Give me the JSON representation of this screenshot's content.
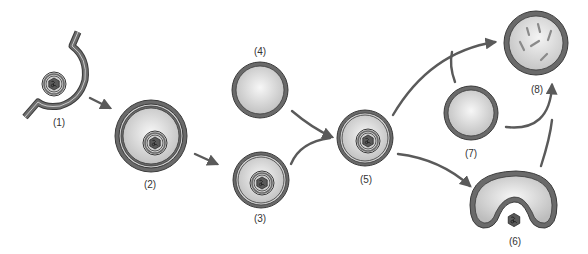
{
  "diagram": {
    "type": "process-flow",
    "colors": {
      "membrane": "#5f5f5f",
      "membrane_outline": "#3a3a3a",
      "fill_light": "#f2f2f2",
      "fill_dark": "#c4c4c4",
      "arrow": "#5a5a5a",
      "cargo": "#4a4a4a"
    },
    "stages": [
      {
        "id": 1,
        "label": "(1)"
      },
      {
        "id": 2,
        "label": "(2)"
      },
      {
        "id": 3,
        "label": "(3)"
      },
      {
        "id": 4,
        "label": "(4)"
      },
      {
        "id": 5,
        "label": "(5)"
      },
      {
        "id": 6,
        "label": "(6)"
      },
      {
        "id": 7,
        "label": "(7)"
      },
      {
        "id": 8,
        "label": "(8)"
      }
    ],
    "edges": [
      {
        "from": 1,
        "to": 2
      },
      {
        "from": 2,
        "to": 3
      },
      {
        "from": 3,
        "to": 5
      },
      {
        "from": 4,
        "to": 5
      },
      {
        "from": 5,
        "to": 8
      },
      {
        "from": 7,
        "to": 8
      },
      {
        "from": 5,
        "to": 6
      },
      {
        "from": 6,
        "to": 8
      }
    ]
  }
}
